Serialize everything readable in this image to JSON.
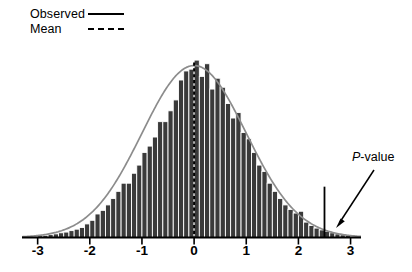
{
  "legend": {
    "items": [
      {
        "label": "Observed",
        "style": "solid",
        "key_name": "observed-line-key"
      },
      {
        "label": "Mean",
        "style": "dashed",
        "key_name": "mean-line-key"
      }
    ]
  },
  "annotations": [
    {
      "name": "p-value-annotation",
      "text": "P-value",
      "italic_prefix": "P",
      "rest": "-value"
    }
  ],
  "colors": {
    "bar_fill": "#3a3a3a",
    "bar_edge": "#ffffff",
    "curve": "#8c8c8c",
    "axis": "#000000",
    "mean_line": "#000000",
    "pvalue_line": "#000000",
    "arrow": "#000000",
    "background": "#ffffff"
  },
  "chart_data": {
    "type": "bar",
    "title": "",
    "subtitle": "",
    "xlabel": "",
    "ylabel": "",
    "grid": false,
    "legend_position": "top-left",
    "xlim": [
      -3.3,
      3.2
    ],
    "ylim": [
      0,
      1.08
    ],
    "xticks": [
      -3,
      -2,
      -1,
      0,
      1,
      2,
      3
    ],
    "xticklabels": [
      "-3",
      "-2",
      "-1",
      "0",
      "1",
      "2",
      "3"
    ],
    "yticks": [],
    "yticklabels": [],
    "bin_width": 0.1,
    "categories": [
      -2.95,
      -2.85,
      -2.75,
      -2.65,
      -2.55,
      -2.45,
      -2.35,
      -2.25,
      -2.15,
      -2.05,
      -1.95,
      -1.85,
      -1.75,
      -1.65,
      -1.55,
      -1.45,
      -1.35,
      -1.25,
      -1.15,
      -1.05,
      -0.95,
      -0.85,
      -0.75,
      -0.65,
      -0.55,
      -0.45,
      -0.35,
      -0.25,
      -0.15,
      -0.05,
      0.05,
      0.15,
      0.25,
      0.35,
      0.45,
      0.55,
      0.65,
      0.75,
      0.85,
      0.95,
      1.05,
      1.15,
      1.25,
      1.35,
      1.45,
      1.55,
      1.65,
      1.75,
      1.85,
      1.95,
      2.05,
      2.15,
      2.25,
      2.35,
      2.45,
      2.55,
      2.65,
      2.75,
      2.85,
      2.95
    ],
    "values": [
      0.01,
      0.012,
      0.016,
      0.02,
      0.026,
      0.03,
      0.038,
      0.046,
      0.055,
      0.075,
      0.095,
      0.13,
      0.15,
      0.18,
      0.215,
      0.255,
      0.3,
      0.3,
      0.355,
      0.4,
      0.47,
      0.505,
      0.555,
      0.64,
      0.64,
      0.7,
      0.76,
      0.87,
      0.92,
      0.93,
      0.98,
      0.89,
      0.96,
      0.82,
      0.88,
      0.83,
      0.74,
      0.66,
      0.69,
      0.58,
      0.545,
      0.47,
      0.4,
      0.365,
      0.3,
      0.255,
      0.215,
      0.18,
      0.155,
      0.135,
      0.145,
      0.085,
      0.066,
      0.052,
      0.042,
      0.034,
      0.026,
      0.02,
      0.015,
      0.011
    ],
    "series": [
      {
        "name": "Observed",
        "type": "bar",
        "values": [
          0.01,
          0.012,
          0.016,
          0.02,
          0.026,
          0.03,
          0.038,
          0.046,
          0.055,
          0.075,
          0.095,
          0.13,
          0.15,
          0.18,
          0.215,
          0.255,
          0.3,
          0.3,
          0.355,
          0.4,
          0.47,
          0.505,
          0.555,
          0.64,
          0.64,
          0.7,
          0.76,
          0.87,
          0.92,
          0.93,
          0.98,
          0.89,
          0.96,
          0.82,
          0.88,
          0.83,
          0.74,
          0.66,
          0.69,
          0.58,
          0.545,
          0.47,
          0.4,
          0.365,
          0.3,
          0.255,
          0.215,
          0.18,
          0.155,
          0.135,
          0.145,
          0.085,
          0.066,
          0.052,
          0.042,
          0.034,
          0.026,
          0.02,
          0.015,
          0.011
        ]
      },
      {
        "name": "Normal curve",
        "type": "line",
        "distribution": "normal",
        "mean": 0,
        "sd": 1,
        "peak": 0.95
      }
    ],
    "reference_lines": [
      {
        "name": "mean",
        "orientation": "vertical",
        "value": 0,
        "style": "dashed",
        "label": "Mean"
      },
      {
        "name": "p-value-cutoff",
        "orientation": "vertical",
        "value": 2.5,
        "style": "solid",
        "label": "P-value",
        "height_fraction": 0.26
      }
    ]
  }
}
